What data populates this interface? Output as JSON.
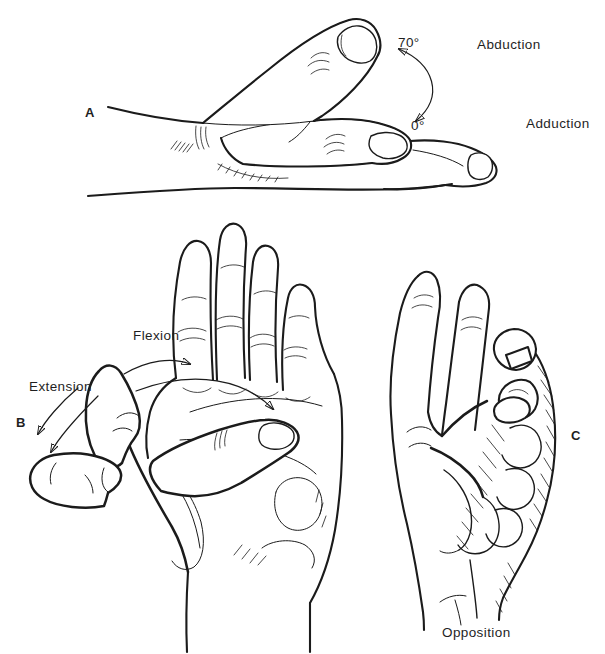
{
  "colors": {
    "background": "#ffffff",
    "ink": "#1b1b1b"
  },
  "panel_a": {
    "letter": "A",
    "abduction_angle": "70°",
    "adduction_angle": "0°",
    "abduction_label": "Abduction",
    "adduction_label": "Adduction"
  },
  "panel_b": {
    "letter": "B",
    "flexion_label": "Flexion",
    "extension_label": "Extension"
  },
  "panel_c": {
    "letter": "C",
    "opposition_label": "Opposition"
  }
}
